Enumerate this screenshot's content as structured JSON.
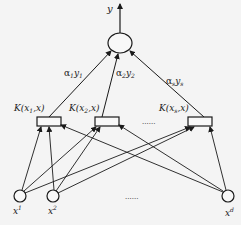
{
  "diagram": {
    "type": "svm-network",
    "colors": {
      "stroke": "#1a1a1a",
      "background": "#f4f4f4"
    },
    "output": {
      "label": "y",
      "center": [
        120,
        43
      ],
      "rx": 12,
      "ry": 10
    },
    "weights": [
      {
        "alpha": "α",
        "sub_a": "1",
        "y": "y",
        "sub_y": "1",
        "pos": [
          64,
          76
        ]
      },
      {
        "alpha": "α",
        "sub_a": "2",
        "y": "y",
        "sub_y": "2",
        "pos": [
          116,
          76
        ]
      },
      {
        "alpha": "α",
        "sub_a": "s",
        "y": "y",
        "sub_y": "s",
        "pos": [
          166,
          84
        ]
      }
    ],
    "kernels": [
      {
        "label_pre": "K(x",
        "sub": "1",
        "label_post": ",x)",
        "box": [
          37,
          117,
          24,
          9
        ],
        "label_pos": [
          14,
          111
        ]
      },
      {
        "label_pre": "K(x",
        "sub": "2",
        "label_post": ",x)",
        "box": [
          95,
          117,
          24,
          9
        ],
        "label_pos": [
          69,
          111
        ]
      },
      {
        "label_pre": "K(x",
        "sub": "s",
        "label_post": ",x)",
        "box": [
          188,
          117,
          24,
          9
        ],
        "label_pos": [
          159,
          111
        ]
      }
    ],
    "kernel_ellipsis": "......",
    "inputs": [
      {
        "label": "x",
        "sup": "1",
        "center": [
          20,
          196
        ],
        "r": 6
      },
      {
        "label": "x",
        "sup": "2",
        "center": [
          53,
          196
        ],
        "r": 6
      },
      {
        "label": "x",
        "sup": "d",
        "center": [
          228,
          196
        ],
        "r": 6
      }
    ],
    "input_ellipsis": "......"
  }
}
